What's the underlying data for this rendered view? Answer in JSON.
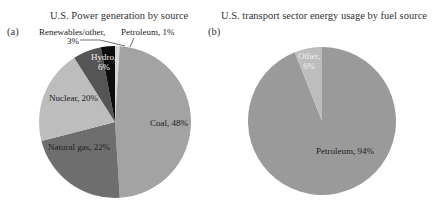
{
  "chart_data": [
    {
      "type": "pie",
      "panel": "(a)",
      "title": "U.S. Power generation by source",
      "labels": [
        "Coal",
        "Natural gas",
        "Nuclear",
        "Hydro",
        "Renewables/other",
        "Petroleum"
      ],
      "values": [
        48,
        22,
        20,
        6,
        3,
        1
      ],
      "label_text": [
        "Coal, 48%",
        "Natural gas, 22%",
        "Nuclear, 20%",
        "Hydro, 6%",
        "Renewables/other, 3%",
        "Petroleum, 1%"
      ],
      "colors": [
        "#a3a3a3",
        "#6e6e6e",
        "#bdbdbd",
        "#555555",
        "#0d0d0d",
        "#d8d8d8"
      ]
    },
    {
      "type": "pie",
      "panel": "(b)",
      "title": "U.S. transport sector energy usage by fuel source",
      "labels": [
        "Petroleum",
        "Other"
      ],
      "values": [
        94,
        6
      ],
      "label_text": [
        "Petroleum, 94%",
        "Other, 6%"
      ],
      "colors": [
        "#9a9a9a",
        "#bdbdbd"
      ]
    }
  ],
  "panels": {
    "a": {
      "label": "(a)",
      "title": "U.S. Power generation by source",
      "coal": "Coal, 48%",
      "gas": "Natural gas, 22%",
      "nuclear": "Nuclear, 20%",
      "hydro_1": "Hydro,",
      "hydro_2": "6%",
      "renew_1": "Renewables/other,",
      "renew_2": "3%",
      "petroleum": "Petroleum, 1%"
    },
    "b": {
      "label": "(b)",
      "title": "U.S. transport sector energy usage by fuel source",
      "petroleum": "Petroleum, 94%",
      "other_1": "Other,",
      "other_2": "6%"
    }
  }
}
